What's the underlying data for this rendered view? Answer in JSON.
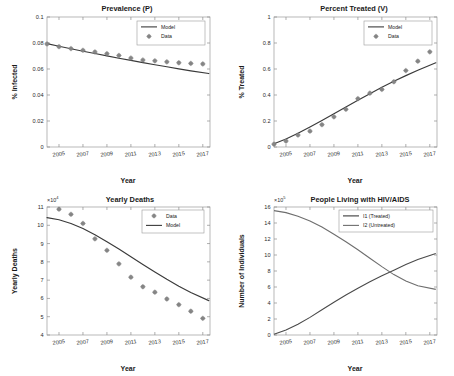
{
  "figure": {
    "background": "#ffffff",
    "panel_count": 4
  },
  "chart_data": [
    {
      "id": "prevalence",
      "type": "scatter",
      "title": "Prevalence (P)",
      "xlabel": "Year",
      "ylabel": "% Infected",
      "xlim": [
        2004,
        2017.6
      ],
      "ylim": [
        0,
        0.1
      ],
      "xticks": [
        2005,
        2007,
        2009,
        2011,
        2013,
        2015,
        2017
      ],
      "yticks": [
        0,
        0.02,
        0.04,
        0.06,
        0.08,
        0.1
      ],
      "ytick_labels": [
        "0",
        "0.02",
        "0.04",
        "0.06",
        "0.08",
        "0.1"
      ],
      "grid": false,
      "legend_position": "top-right",
      "legend": [
        "Model",
        "Data"
      ],
      "series": [
        {
          "name": "Model",
          "kind": "line",
          "x": [
            2004,
            2005,
            2006,
            2007,
            2008,
            2009,
            2010,
            2011,
            2012,
            2013,
            2014,
            2015,
            2016,
            2017.5
          ],
          "values": [
            0.0795,
            0.0775,
            0.0756,
            0.0737,
            0.0719,
            0.0701,
            0.0683,
            0.0666,
            0.0649,
            0.0633,
            0.0617,
            0.0601,
            0.0586,
            0.0565
          ]
        },
        {
          "name": "Data",
          "kind": "marker",
          "x": [
            2004,
            2005,
            2006,
            2007,
            2008,
            2009,
            2010,
            2011,
            2012,
            2013,
            2014,
            2015,
            2016,
            2017
          ],
          "values": [
            0.0793,
            0.0772,
            0.0757,
            0.0744,
            0.0731,
            0.0718,
            0.0704,
            0.0684,
            0.0669,
            0.0663,
            0.0655,
            0.0648,
            0.0643,
            0.0639
          ]
        }
      ]
    },
    {
      "id": "percent-treated",
      "type": "scatter",
      "title": "Percent Treated (V)",
      "xlabel": "Year",
      "ylabel": "% Treated",
      "xlim": [
        2004,
        2017.6
      ],
      "ylim": [
        0,
        1
      ],
      "xticks": [
        2005,
        2007,
        2009,
        2011,
        2013,
        2015,
        2017
      ],
      "yticks": [
        0,
        0.2,
        0.4,
        0.6,
        0.8,
        1
      ],
      "ytick_labels": [
        "0",
        "0.2",
        "0.4",
        "0.6",
        "0.8",
        "1"
      ],
      "grid": false,
      "legend_position": "top-right",
      "legend": [
        "Model",
        "Data"
      ],
      "series": [
        {
          "name": "Model",
          "kind": "line",
          "x": [
            2004,
            2005,
            2006,
            2007,
            2008,
            2009,
            2010,
            2011,
            2012,
            2013,
            2014,
            2015,
            2016,
            2017.5
          ],
          "values": [
            0.025,
            0.062,
            0.105,
            0.153,
            0.203,
            0.255,
            0.307,
            0.359,
            0.41,
            0.459,
            0.505,
            0.549,
            0.59,
            0.648
          ]
        },
        {
          "name": "Data",
          "kind": "marker",
          "x": [
            2004,
            2005,
            2006,
            2007,
            2008,
            2009,
            2010,
            2011,
            2012,
            2013,
            2014,
            2015,
            2016,
            2017
          ],
          "values": [
            0.022,
            0.046,
            0.092,
            0.122,
            0.172,
            0.232,
            0.29,
            0.372,
            0.414,
            0.443,
            0.502,
            0.588,
            0.66,
            0.732
          ]
        }
      ]
    },
    {
      "id": "yearly-deaths",
      "type": "scatter",
      "title": "Yearly Deaths",
      "xlabel": "Year",
      "ylabel": "Yearly Deaths",
      "y_multiplier": "×10",
      "y_exponent": "4",
      "xlim": [
        2004,
        2017.6
      ],
      "ylim": [
        4,
        11
      ],
      "xticks": [
        2005,
        2007,
        2009,
        2011,
        2013,
        2015,
        2017
      ],
      "yticks": [
        4,
        5,
        6,
        7,
        8,
        9,
        10,
        11
      ],
      "ytick_labels": [
        "4",
        "5",
        "6",
        "7",
        "8",
        "9",
        "10",
        "11"
      ],
      "grid": false,
      "legend_position": "top-right",
      "legend": [
        "Data",
        "Model"
      ],
      "series": [
        {
          "name": "Data",
          "kind": "marker",
          "x": [
            2005,
            2006,
            2007,
            2008,
            2009,
            2010,
            2011,
            2012,
            2013,
            2014,
            2015,
            2016,
            2017
          ],
          "values": [
            10.88,
            10.6,
            10.1,
            9.26,
            8.63,
            7.89,
            7.16,
            6.64,
            6.34,
            5.97,
            5.66,
            5.3,
            4.91
          ]
        },
        {
          "name": "Model",
          "kind": "line",
          "x": [
            2004,
            2005,
            2006,
            2007,
            2008,
            2009,
            2010,
            2011,
            2012,
            2013,
            2014,
            2015,
            2016,
            2017.5
          ],
          "values": [
            10.42,
            10.3,
            10.1,
            9.82,
            9.48,
            9.1,
            8.7,
            8.28,
            7.86,
            7.45,
            7.05,
            6.67,
            6.32,
            5.88
          ]
        }
      ]
    },
    {
      "id": "people-living-with-hiv",
      "type": "line",
      "title": "People Living with HIV/AIDS",
      "xlabel": "Year",
      "ylabel": "Number of Individuals",
      "y_multiplier": "×10",
      "y_exponent": "5",
      "xlim": [
        2004,
        2017.6
      ],
      "ylim": [
        0,
        16
      ],
      "xticks": [
        2005,
        2007,
        2009,
        2011,
        2013,
        2015,
        2017
      ],
      "yticks": [
        0,
        2,
        4,
        6,
        8,
        10,
        12,
        14,
        16
      ],
      "ytick_labels": [
        "0",
        "2",
        "4",
        "6",
        "8",
        "10",
        "12",
        "14",
        "16"
      ],
      "grid": false,
      "legend_position": "top-right",
      "legend": [
        "I1 (Treated)",
        "I2 (Untreated)"
      ],
      "series": [
        {
          "name": "I1 (Treated)",
          "kind": "line",
          "x": [
            2004,
            2005,
            2006,
            2007,
            2008,
            2009,
            2010,
            2011,
            2012,
            2013,
            2014,
            2015,
            2016,
            2017.5
          ],
          "values": [
            0.1,
            0.62,
            1.35,
            2.2,
            3.15,
            4.1,
            5.0,
            5.85,
            6.65,
            7.4,
            8.1,
            8.8,
            9.45,
            10.2
          ]
        },
        {
          "name": "I2 (Untreated)",
          "kind": "line",
          "x": [
            2004,
            2005,
            2006,
            2007,
            2008,
            2009,
            2010,
            2011,
            2012,
            2013,
            2014,
            2015,
            2016,
            2017.5
          ],
          "values": [
            15.55,
            15.3,
            14.85,
            14.25,
            13.5,
            12.6,
            11.65,
            10.65,
            9.6,
            8.55,
            7.55,
            6.75,
            6.15,
            5.7
          ]
        }
      ]
    }
  ]
}
